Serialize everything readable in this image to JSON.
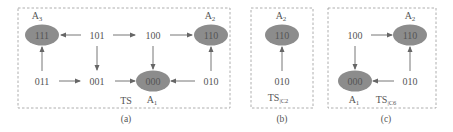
{
  "panels": [
    {
      "caption": "(a)",
      "label": "TS",
      "nodes": [
        {
          "id": "111",
          "text": "111",
          "accepting": true,
          "tag": "A3"
        },
        {
          "id": "101",
          "text": "101",
          "accepting": false
        },
        {
          "id": "100",
          "text": "100",
          "accepting": false
        },
        {
          "id": "110",
          "text": "110",
          "accepting": true,
          "tag": "A2"
        },
        {
          "id": "011",
          "text": "011",
          "accepting": false
        },
        {
          "id": "001",
          "text": "001",
          "accepting": false
        },
        {
          "id": "000",
          "text": "000",
          "accepting": true,
          "tag": "A1"
        },
        {
          "id": "010",
          "text": "010",
          "accepting": false
        }
      ],
      "edges": [
        [
          "101",
          "111"
        ],
        [
          "101",
          "100"
        ],
        [
          "100",
          "110"
        ],
        [
          "011",
          "111"
        ],
        [
          "101",
          "001"
        ],
        [
          "100",
          "000"
        ],
        [
          "010",
          "110"
        ],
        [
          "011",
          "001"
        ],
        [
          "001",
          "000"
        ],
        [
          "010",
          "000"
        ]
      ]
    },
    {
      "caption": "(b)",
      "label": "TS|C2",
      "label_main": "TS",
      "label_sub": "C2",
      "nodes": [
        {
          "id": "110",
          "text": "110",
          "accepting": true,
          "tag": "A2"
        },
        {
          "id": "010",
          "text": "010",
          "accepting": false
        }
      ],
      "edges": [
        [
          "010",
          "110"
        ]
      ]
    },
    {
      "caption": "(c)",
      "label": "TS|C6",
      "label_main": "TS",
      "label_sub": "C6",
      "nodes": [
        {
          "id": "100",
          "text": "100",
          "accepting": false
        },
        {
          "id": "110",
          "text": "110",
          "accepting": true,
          "tag": "A2"
        },
        {
          "id": "000",
          "text": "000",
          "accepting": true,
          "tag": "A1"
        },
        {
          "id": "010",
          "text": "010",
          "accepting": false
        }
      ],
      "edges": [
        [
          "100",
          "110"
        ],
        [
          "100",
          "000"
        ],
        [
          "010",
          "110"
        ],
        [
          "010",
          "000"
        ]
      ]
    }
  ],
  "tags": {
    "A1": "A",
    "A1_sub": "1",
    "A2": "A",
    "A2_sub": "2",
    "A3": "A",
    "A3_sub": "3"
  },
  "colors": {
    "accepting_fill": "#8c8c8c",
    "edge": "#666666",
    "border": "#9a9a9a"
  }
}
